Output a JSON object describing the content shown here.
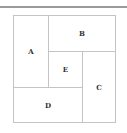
{
  "diagram": {
    "type": "pinwheel-rectangle-partition",
    "regions": [
      {
        "id": "A",
        "label": "A"
      },
      {
        "id": "B",
        "label": "B"
      },
      {
        "id": "C",
        "label": "C"
      },
      {
        "id": "D",
        "label": "D"
      },
      {
        "id": "E",
        "label": "E"
      }
    ]
  }
}
